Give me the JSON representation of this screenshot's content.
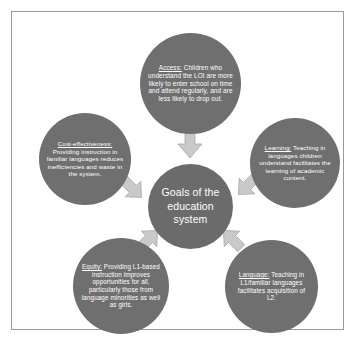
{
  "diagram": {
    "title": "Goals of the education system",
    "center": {
      "label": "Goals of the education system"
    },
    "colors": {
      "circle_fill": "#6f6f6f",
      "center_fill": "#6b6b6b",
      "arrow_fill": "#c9c9c9",
      "arrow_stroke": "#a8a8a8",
      "text": "#ffffff",
      "frame_border": "#9a9a9a",
      "background": "#ffffff"
    },
    "nodes": [
      {
        "id": "access",
        "position": "top",
        "keyword": "Access:",
        "body": " Children who understand the LOI are more likely to enter school on time and attend regularly, and are less likely to drop out."
      },
      {
        "id": "cost-effectiveness",
        "position": "upper-left",
        "keyword": "Cost-effectiveness:",
        "body": " Providing instruction in familiar languages reduces inefficiencies and waste in the system."
      },
      {
        "id": "learning",
        "position": "upper-right",
        "keyword": "Learning:",
        "body": " Teaching in languages children understand facilitates the learning of academic content."
      },
      {
        "id": "equity",
        "position": "lower-left",
        "keyword": "Equity:",
        "body": " Providing L1-based instruction improves opportunities for all, particularly those from language minorities as well as girls."
      },
      {
        "id": "language",
        "position": "lower-right",
        "keyword": "Language:",
        "body": " Teaching in L1/familiar languages facilitates acquisition of L2."
      }
    ],
    "arrows": [
      {
        "id": "arrow-top",
        "from": "access",
        "to": "center",
        "direction": "down"
      },
      {
        "id": "arrow-left",
        "from": "cost-effectiveness",
        "to": "center",
        "direction": "down-right"
      },
      {
        "id": "arrow-right",
        "from": "learning",
        "to": "center",
        "direction": "down-left"
      },
      {
        "id": "arrow-bottomleft",
        "from": "equity",
        "to": "center",
        "direction": "up-right"
      },
      {
        "id": "arrow-bottomright",
        "from": "language",
        "to": "center",
        "direction": "up-left"
      }
    ]
  }
}
